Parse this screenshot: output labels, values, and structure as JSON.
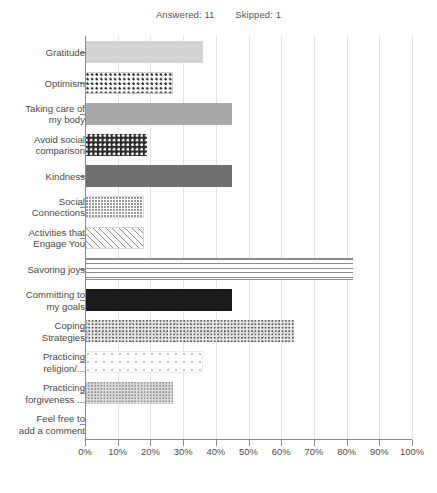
{
  "header": {
    "answered_label": "Answered: 11",
    "skipped_label": "Skipped: 1"
  },
  "chart_data": {
    "type": "bar",
    "orientation": "horizontal",
    "title": "",
    "xlabel": "",
    "ylabel": "",
    "xlim": [
      0,
      100
    ],
    "grid": true,
    "legend": false,
    "xticks": [
      "0%",
      "10%",
      "20%",
      "30%",
      "40%",
      "50%",
      "60%",
      "70%",
      "80%",
      "90%",
      "100%"
    ],
    "xtick_values": [
      0,
      10,
      20,
      30,
      40,
      50,
      60,
      70,
      80,
      90,
      100
    ],
    "categories": [
      "Gratitude",
      "Optimism",
      "Taking care of\nmy body",
      "Avoid social\ncomparison",
      "Kindness",
      "Social\nConnections",
      "Activities that\nEngage You",
      "Savoring joys",
      "Committing to\nmy goals",
      "Coping\nStrategies",
      "Practicing\nreligion/...",
      "Practicing\nforgiveness ...",
      "Feel free to\nadd a comment"
    ],
    "values": [
      36,
      27,
      45,
      19,
      45,
      18,
      18,
      82,
      45,
      64,
      36,
      27,
      0
    ],
    "fills": [
      "p-solid-light",
      "p-checker-light",
      "p-solid-mid",
      "p-checker-dark",
      "p-solid-dark",
      "p-dots-fine",
      "p-hatch",
      "p-hlines",
      "p-solid-black",
      "p-speckle",
      "p-speckle-sparse",
      "p-speckle-dense",
      "p-none"
    ]
  }
}
